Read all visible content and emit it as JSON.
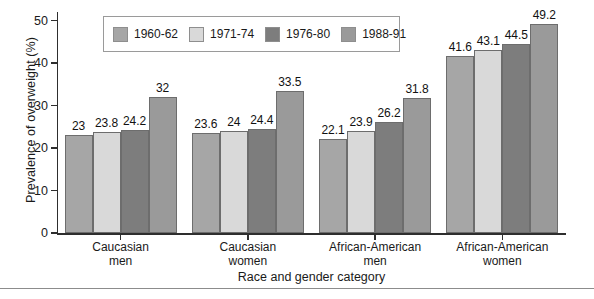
{
  "chart_data": {
    "type": "bar",
    "title": "",
    "xlabel": "Race and gender category",
    "ylabel": "Prevalence of overweight (%)",
    "categories": [
      "Caucasian men",
      "Caucasian women",
      "African-American men",
      "African-American women"
    ],
    "category_lines": [
      [
        "Caucasian",
        "men"
      ],
      [
        "Caucasian",
        "women"
      ],
      [
        "African-American",
        "men"
      ],
      [
        "African-American",
        "women"
      ]
    ],
    "series": [
      {
        "name": "1960-62",
        "color": "#a6a6a6",
        "values": [
          23,
          23.6,
          22.1,
          41.6
        ]
      },
      {
        "name": "1971-74",
        "color": "#d9d9d9",
        "values": [
          23.8,
          24,
          23.9,
          43.1
        ]
      },
      {
        "name": "1976-80",
        "color": "#7d7d7d",
        "values": [
          24.2,
          24.4,
          26.2,
          44.5
        ]
      },
      {
        "name": "1988-91",
        "color": "#9a9a9a",
        "values": [
          32,
          33.5,
          31.8,
          49.2
        ]
      }
    ],
    "value_labels": [
      [
        "23",
        "23.8",
        "24.2",
        "32"
      ],
      [
        "23.6",
        "24",
        "24.4",
        "33.5"
      ],
      [
        "22.1",
        "23.9",
        "26.2",
        "31.8"
      ],
      [
        "41.6",
        "43.1",
        "44.5",
        "49.2"
      ]
    ],
    "ylim": [
      0,
      52
    ],
    "yticks": [
      0,
      10,
      20,
      30,
      40,
      50
    ],
    "ytick_labels": [
      "0",
      "10",
      "20",
      "30",
      "40",
      "50"
    ],
    "grid": false,
    "legend_position": "top-center",
    "legend_entries": [
      "1960-62",
      "1971-74",
      "1976-80",
      "1988-91"
    ]
  }
}
